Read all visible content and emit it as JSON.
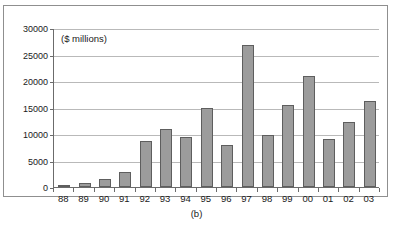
{
  "figure": {
    "caption": "(b)",
    "units_label": "($ millions)"
  },
  "chart_data": {
    "type": "bar",
    "title": "",
    "subtitle": "",
    "xlabel": "",
    "ylabel": "($ millions)",
    "ylim": [
      0,
      30000
    ],
    "ytick_values": [
      0,
      5000,
      10000,
      15000,
      20000,
      25000,
      30000
    ],
    "ytick_labels": [
      "0",
      "5000",
      "10000",
      "15000",
      "20000",
      "25000",
      "30000"
    ],
    "grid": "horizontal",
    "legend": "none",
    "annotations": [
      "($ millions)"
    ],
    "categories": [
      "88",
      "89",
      "90",
      "91",
      "92",
      "93",
      "94",
      "95",
      "96",
      "97",
      "98",
      "99",
      "00",
      "01",
      "02",
      "03"
    ],
    "values": [
      100,
      800,
      1500,
      2900,
      8700,
      11000,
      9400,
      15000,
      8000,
      26800,
      9800,
      15400,
      21000,
      9000,
      12200,
      16300
    ],
    "bar_color": "#9c9c9c",
    "bar_edge_color": "#5e5e5e",
    "gridline_color": "#b9b9b9",
    "axis_color": "#6b6b6b"
  }
}
